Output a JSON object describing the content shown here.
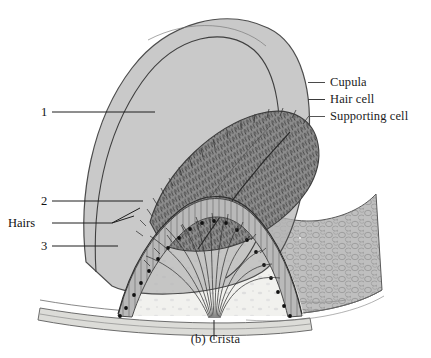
{
  "figure": {
    "caption": "(b) Crista",
    "style": "grayscale anatomical line illustration"
  },
  "callouts": [
    {
      "id": "label-1",
      "text": "1",
      "target": "cupula"
    },
    {
      "id": "label-2",
      "text": "2",
      "target": "hair-cell-layer"
    },
    {
      "id": "label-hairs",
      "text": "Hairs",
      "target": "sensory-hairs"
    },
    {
      "id": "label-3",
      "text": "3",
      "target": "supporting-cell-layer"
    }
  ],
  "legend": {
    "items": [
      {
        "label": "Cupula",
        "swatch": "dash",
        "color": "#4a4a4a"
      },
      {
        "label": "Hair cell",
        "swatch": "dash",
        "color": "#3a3a3a"
      },
      {
        "label": "Supporting cell",
        "swatch": "dash",
        "color": "#555555"
      }
    ]
  },
  "palette": {
    "background": "#ffffff",
    "cupula_fill": "#b4b4b4",
    "cupula_stroke": "#4d4d4d",
    "ridge_fill": "#8f8f8f",
    "tissue_fill": "#bdbdbd",
    "tissue_light": "#d2d2d2",
    "lumen_fill": "#f1f1ee",
    "nuclei": "#111111",
    "ink": "#3c3c3c"
  }
}
